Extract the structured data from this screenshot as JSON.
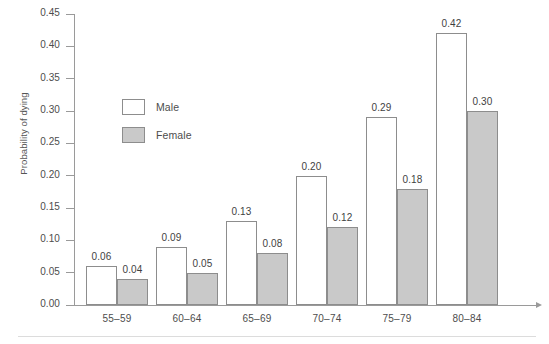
{
  "chart_data": {
    "type": "bar",
    "title": "",
    "xlabel": "",
    "ylabel": "Probability of dying",
    "categories": [
      "55–59",
      "60–64",
      "65–69",
      "70–74",
      "75–79",
      "80–84"
    ],
    "series": [
      {
        "name": "Male",
        "values": [
          0.06,
          0.09,
          0.13,
          0.2,
          0.29,
          0.42
        ],
        "color": "#ffffff"
      },
      {
        "name": "Female",
        "values": [
          0.04,
          0.05,
          0.08,
          0.12,
          0.18,
          0.3
        ],
        "color": "#c9c9c9"
      }
    ],
    "data_labels": [
      [
        "0.06",
        "0.04"
      ],
      [
        "0.09",
        "0.05"
      ],
      [
        "0.13",
        "0.08"
      ],
      [
        "0.20",
        "0.12"
      ],
      [
        "0.29",
        "0.18"
      ],
      [
        "0.42",
        "0.30"
      ]
    ],
    "ylim": [
      0.0,
      0.45
    ],
    "ytick_labels": [
      "0.45",
      "0.40",
      "0.35",
      "0.30",
      "0.25",
      "0.20",
      "0.15",
      "0.10",
      "0.05",
      "0.00"
    ],
    "ytick_values": [
      0.45,
      0.4,
      0.35,
      0.3,
      0.25,
      0.2,
      0.15,
      0.1,
      0.05,
      0.0
    ],
    "grid": false,
    "legend_position": "inside-upper-left",
    "legend": [
      "Male",
      "Female"
    ],
    "axis_color": "#9a9a9a",
    "bar_outline_color": "#8d8d8d"
  }
}
